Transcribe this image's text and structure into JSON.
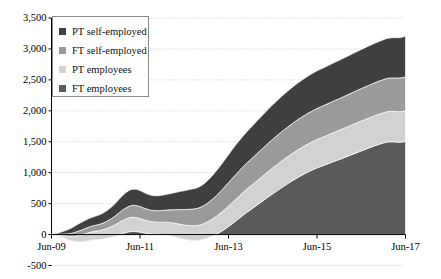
{
  "chart_data": {
    "type": "area",
    "stacked": true,
    "title": "",
    "subtitle": "",
    "xlabel": "",
    "ylabel": "",
    "grid": true,
    "gridlines_style": "dotted-horizontal",
    "legend_position": "top-left-inside",
    "ylim": [
      -500,
      3500
    ],
    "yticks": [
      -500,
      0,
      500,
      1000,
      1500,
      2000,
      2500,
      3000,
      3500
    ],
    "ytick_labels": [
      "-500",
      "0",
      "500",
      "1,000",
      "1,500",
      "2,000",
      "2,500",
      "3,000",
      "3,500"
    ],
    "xticks": [
      "Jun-09",
      "Jun-11",
      "Jun-13",
      "Jun-15",
      "Jun-17"
    ],
    "xtick_labels": [
      "Jun-09",
      "Jun-11",
      "Jun-13",
      "Jun-15",
      "Jun-17"
    ],
    "xlim": [
      "Jun-09",
      "Jun-17"
    ],
    "x_count": 97,
    "stack_order_bottom_to_top": [
      "FT employees",
      "PT employees",
      "FT self-employed",
      "PT self-employed"
    ],
    "series": [
      {
        "name": "FT employees",
        "color": "#5a5a5a",
        "values": [
          0,
          -10,
          -25,
          -45,
          -70,
          -95,
          -110,
          -118,
          -120,
          -112,
          -100,
          -92,
          -85,
          -80,
          -72,
          -60,
          -45,
          -30,
          -10,
          12,
          30,
          45,
          52,
          48,
          40,
          28,
          18,
          10,
          5,
          2,
          0,
          -5,
          -15,
          -28,
          -45,
          -62,
          -78,
          -88,
          -95,
          -98,
          -92,
          -80,
          -62,
          -40,
          -15,
          15,
          50,
          88,
          130,
          175,
          220,
          268,
          315,
          360,
          402,
          445,
          490,
          532,
          575,
          618,
          660,
          700,
          742,
          782,
          820,
          858,
          895,
          930,
          962,
          995,
          1025,
          1052,
          1078,
          1100,
          1122,
          1145,
          1168,
          1190,
          1212,
          1235,
          1258,
          1282,
          1305,
          1328,
          1352,
          1375,
          1398,
          1420,
          1442,
          1462,
          1480,
          1495,
          1500,
          1498,
          1492,
          1495,
          1505
        ]
      },
      {
        "name": "PT employees",
        "color": "#d2d2d2",
        "values": [
          0,
          8,
          18,
          30,
          45,
          62,
          80,
          98,
          112,
          122,
          130,
          136,
          140,
          145,
          152,
          160,
          170,
          182,
          195,
          208,
          218,
          225,
          228,
          226,
          220,
          212,
          205,
          200,
          198,
          198,
          200,
          204,
          210,
          216,
          222,
          228,
          232,
          235,
          238,
          240,
          244,
          250,
          258,
          268,
          280,
          292,
          305,
          318,
          330,
          342,
          352,
          360,
          368,
          375,
          382,
          388,
          394,
          400,
          406,
          412,
          418,
          423,
          428,
          432,
          436,
          440,
          444,
          447,
          450,
          452,
          455,
          457,
          460,
          462,
          464,
          466,
          468,
          470,
          472,
          474,
          476,
          478,
          480,
          482,
          483,
          484,
          485,
          486,
          487,
          488,
          489,
          490,
          491,
          492,
          493,
          494,
          495
        ]
      },
      {
        "name": "FT self-employed",
        "color": "#9a9a9a",
        "values": [
          0,
          6,
          14,
          24,
          36,
          48,
          60,
          70,
          78,
          84,
          88,
          92,
          96,
          100,
          106,
          114,
          124,
          136,
          150,
          165,
          178,
          188,
          194,
          196,
          194,
          190,
          186,
          184,
          184,
          186,
          190,
          196,
          204,
          214,
          226,
          238,
          250,
          260,
          268,
          274,
          280,
          288,
          298,
          310,
          324,
          338,
          352,
          366,
          378,
          390,
          400,
          408,
          416,
          422,
          428,
          434,
          440,
          446,
          452,
          458,
          463,
          468,
          472,
          476,
          480,
          483,
          486,
          489,
          492,
          494,
          496,
          498,
          500,
          502,
          504,
          506,
          508,
          510,
          512,
          514,
          516,
          518,
          520,
          522,
          524,
          526,
          528,
          530,
          532,
          534,
          536,
          538,
          540,
          542,
          544,
          546,
          548
        ]
      },
      {
        "name": "PT self-employed",
        "color": "#3f3f3f",
        "values": [
          0,
          10,
          24,
          40,
          58,
          78,
          96,
          112,
          124,
          132,
          138,
          143,
          148,
          154,
          162,
          172,
          184,
          198,
          214,
          230,
          244,
          254,
          260,
          262,
          258,
          252,
          246,
          242,
          240,
          242,
          246,
          252,
          260,
          270,
          282,
          294,
          306,
          316,
          324,
          330,
          338,
          348,
          360,
          374,
          390,
          406,
          422,
          438,
          452,
          466,
          478,
          488,
          498,
          506,
          514,
          522,
          530,
          538,
          545,
          552,
          558,
          564,
          570,
          575,
          580,
          584,
          588,
          592,
          596,
          599,
          602,
          605,
          608,
          610,
          612,
          614,
          616,
          618,
          620,
          622,
          624,
          626,
          628,
          630,
          632,
          634,
          636,
          638,
          640,
          642,
          644,
          646,
          648,
          650,
          652,
          654,
          656
        ]
      }
    ]
  },
  "legend": {
    "items": [
      {
        "label": "PT self-employed",
        "color": "#3f3f3f"
      },
      {
        "label": "FT self-employed",
        "color": "#9a9a9a"
      },
      {
        "label": "PT employees",
        "color": "#d2d2d2"
      },
      {
        "label": "FT employees",
        "color": "#5a5a5a"
      }
    ]
  },
  "axes": {
    "y_labels": [
      "3,500",
      "3,000",
      "2,500",
      "2,000",
      "1,500",
      "1,000",
      "500",
      "0",
      "-500"
    ],
    "x_labels": [
      "Jun-09",
      "Jun-11",
      "Jun-13",
      "Jun-15",
      "Jun-17"
    ]
  }
}
